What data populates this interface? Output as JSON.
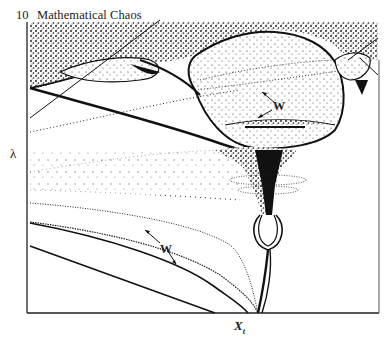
{
  "page": {
    "number": "10",
    "running_title": "Mathematical Chaos"
  },
  "figure": {
    "y_axis_label": "λ",
    "x_axis_label": "X",
    "x_axis_subscript": "t",
    "annotations": [
      {
        "label": "W",
        "position": "upper-right, inside central bubble"
      },
      {
        "label": "W",
        "position": "lower-left, between curves"
      }
    ]
  }
}
